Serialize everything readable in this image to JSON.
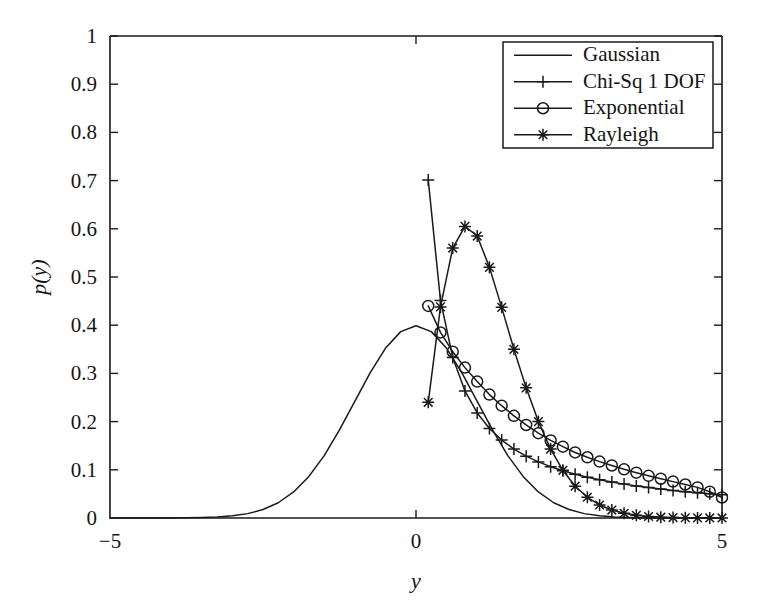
{
  "chart_data": {
    "type": "line",
    "title": "",
    "xlabel": "y",
    "ylabel": "p(y)",
    "xlim": [
      -5,
      5
    ],
    "ylim": [
      0,
      1
    ],
    "grid": false,
    "legend_position": "top-right",
    "xticks": [
      -5,
      0,
      5
    ],
    "xtick_labels": [
      "−5",
      "0",
      "5"
    ],
    "yticks": [
      0,
      0.1,
      0.2,
      0.3,
      0.4,
      0.5,
      0.6,
      0.7,
      0.8,
      0.9,
      1
    ],
    "ytick_labels": [
      "0",
      "0.1",
      "0.2",
      "0.3",
      "0.4",
      "0.5",
      "0.6",
      "0.7",
      "0.8",
      "0.9",
      "1"
    ],
    "series": [
      {
        "name": "Gaussian",
        "marker": "none",
        "x": [
          -5,
          -4.75,
          -4.5,
          -4.25,
          -4,
          -3.75,
          -3.5,
          -3.25,
          -3,
          -2.75,
          -2.5,
          -2.25,
          -2,
          -1.75,
          -1.5,
          -1.25,
          -1,
          -0.75,
          -0.5,
          -0.25,
          0,
          0.25,
          0.5,
          0.75,
          1,
          1.25,
          1.5,
          1.75,
          2,
          2.25,
          2.5,
          2.75,
          3,
          3.25,
          3.5,
          3.75,
          4,
          4.25,
          4.5,
          4.75,
          5
        ],
        "y": [
          1.5e-06,
          6.3e-06,
          1.6e-05,
          3.98e-05,
          0.0001338,
          0.0003324,
          0.0008727,
          0.002075,
          0.0044318,
          0.0090937,
          0.0175283,
          0.031658,
          0.053991,
          0.0862773,
          0.1295176,
          0.1826491,
          0.2419707,
          0.3011374,
          0.3520653,
          0.3866681,
          0.3989423,
          0.3866681,
          0.3520653,
          0.3011374,
          0.2419707,
          0.1826491,
          0.1295176,
          0.0862773,
          0.053991,
          0.031658,
          0.0175283,
          0.0090937,
          0.0044318,
          0.002075,
          0.0008727,
          0.0003324,
          0.0001338,
          3.98e-05,
          1.6e-05,
          6.3e-06,
          1.5e-06
        ]
      },
      {
        "name": "Chi-Sq 1 DOF",
        "marker": "plus",
        "x": [
          0.2,
          0.4,
          0.6,
          0.8,
          1.0,
          1.2,
          1.4,
          1.6,
          1.8,
          2.0,
          2.2,
          2.4,
          2.6,
          2.8,
          3.0,
          3.2,
          3.4,
          3.6,
          3.8,
          4.0,
          4.2,
          4.4,
          4.6,
          4.8,
          5.0
        ],
        "y": [
          0.7015,
          0.4514,
          0.3332,
          0.2636,
          0.218,
          0.1857,
          0.1617,
          0.1431,
          0.1283,
          0.1164,
          0.1065,
          0.0981,
          0.0909,
          0.0847,
          0.0793,
          0.0745,
          0.0703,
          0.0665,
          0.0631,
          0.06,
          0.0572,
          0.0547,
          0.0524,
          0.0502,
          0.0483
        ]
      },
      {
        "name": "Exponential",
        "marker": "circle",
        "x": [
          0.2,
          0.4,
          0.6,
          0.8,
          1.0,
          1.2,
          1.4,
          1.6,
          1.8,
          2.0,
          2.2,
          2.4,
          2.6,
          2.8,
          3.0,
          3.2,
          3.4,
          3.6,
          3.8,
          4.0,
          4.2,
          4.4,
          4.6,
          4.8,
          5.0
        ],
        "y": [
          0.44,
          0.385,
          0.345,
          0.312,
          0.283,
          0.256,
          0.233,
          0.212,
          0.193,
          0.176,
          0.161,
          0.148,
          0.136,
          0.126,
          0.117,
          0.109,
          0.101,
          0.094,
          0.0875,
          0.0815,
          0.0755,
          0.0695,
          0.0635,
          0.0545,
          0.0425
        ]
      },
      {
        "name": "Rayleigh",
        "marker": "star",
        "x": [
          0.2,
          0.4,
          0.6,
          0.8,
          1.0,
          1.2,
          1.4,
          1.6,
          1.8,
          2.0,
          2.2,
          2.4,
          2.6,
          2.8,
          3.0,
          3.2,
          3.4,
          3.6,
          3.8,
          4.0,
          4.2,
          4.4,
          4.6,
          4.8,
          5.0
        ],
        "y": [
          0.24,
          0.438,
          0.56,
          0.605,
          0.585,
          0.52,
          0.437,
          0.35,
          0.27,
          0.2,
          0.143,
          0.099,
          0.066,
          0.043,
          0.027,
          0.0165,
          0.0098,
          0.0056,
          0.0031,
          0.0017,
          0.0009,
          0.0005,
          0.0002,
          0.0001,
          0.0001
        ]
      }
    ]
  },
  "legend": {
    "entries": [
      {
        "label": "Gaussian",
        "marker": "none"
      },
      {
        "label": "Chi-Sq 1 DOF",
        "marker": "plus"
      },
      {
        "label": "Exponential",
        "marker": "circle"
      },
      {
        "label": "Rayleigh",
        "marker": "star"
      }
    ]
  }
}
